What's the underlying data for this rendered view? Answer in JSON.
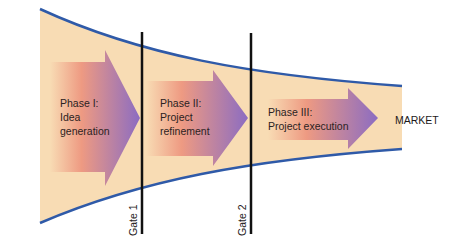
{
  "diagram": {
    "type": "stage-gate funnel",
    "colors": {
      "funnel_fill": "#f8dcb4",
      "funnel_outline": "#2f5aa8",
      "arrow_start": "#f8dcb4",
      "arrow_mid": "#ee9a82",
      "arrow_end": "#8b6cc2",
      "gate_line": "#111111",
      "text": "#2b2222"
    },
    "phases": [
      {
        "title": "Phase I:",
        "line2": "Idea",
        "line3": "generation"
      },
      {
        "title": "Phase II:",
        "line2": "Project",
        "line3": "refinement"
      },
      {
        "title": "Phase III:",
        "line2": "Project execution",
        "line3": ""
      }
    ],
    "gates": [
      {
        "label": "Gate 1"
      },
      {
        "label": "Gate 2"
      }
    ],
    "outcome": {
      "label": "MARKET"
    }
  }
}
